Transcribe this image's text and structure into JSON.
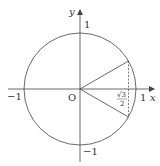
{
  "diagram": {
    "type": "unit-circle",
    "colors": {
      "stroke": "#444444",
      "text": "#333333",
      "background": "#ffffff"
    },
    "axes": {
      "x_label": "x",
      "y_label": "y",
      "origin_label": "O"
    },
    "ticks": {
      "x_pos": "1",
      "x_neg": "−1",
      "y_pos": "1",
      "y_neg": "−1"
    },
    "annotation": {
      "sqrt_num": "√3",
      "denominator": "2",
      "meaning": "√3/2"
    },
    "rays": [
      {
        "angle_deg": 30
      },
      {
        "angle_deg": -30
      }
    ],
    "dashed_line": "vertical segment at x = √3/2 joining the two ray endpoints"
  }
}
